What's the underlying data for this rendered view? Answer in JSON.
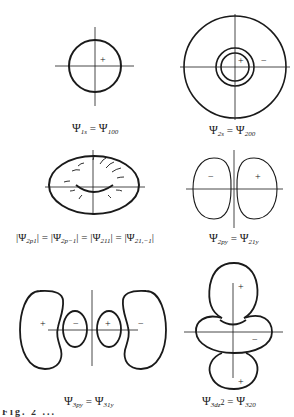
{
  "figure": {
    "panels": [
      {
        "id": "1s",
        "caption_lhs": "Ψ",
        "lhs_sub": "1s",
        "eq": " = ",
        "caption_rhs": "Ψ",
        "rhs_sub": "100",
        "signs": [
          "+"
        ]
      },
      {
        "id": "2s",
        "caption_lhs": "Ψ",
        "lhs_sub": "2s",
        "eq": " = ",
        "caption_rhs": "Ψ",
        "rhs_sub": "200",
        "signs": [
          "+",
          "−"
        ]
      },
      {
        "id": "2p1",
        "caption_text": "|Ψ",
        "sub1": "2p1",
        "t2": "| = |Ψ",
        "sub2": "2p−1",
        "t3": "| = |Ψ",
        "sub3": "211",
        "t4": "| = |Ψ",
        "sub4": "21,−1",
        "t5": "|"
      },
      {
        "id": "2py",
        "caption_lhs": "Ψ",
        "lhs_sub": "2py",
        "eq": " = ",
        "caption_rhs": "Ψ",
        "rhs_sub": "21y",
        "signs": [
          "−",
          "+"
        ]
      },
      {
        "id": "3py",
        "caption_lhs": "Ψ",
        "lhs_sub": "3py",
        "eq": " = ",
        "caption_rhs": "Ψ",
        "rhs_sub": "31y",
        "signs": [
          "+",
          "−",
          "+",
          "−"
        ]
      },
      {
        "id": "3dz2",
        "caption_lhs": "Ψ",
        "lhs_sub": "3dz",
        "lhs_sup": "2",
        "eq": " = ",
        "caption_rhs": "Ψ",
        "rhs_sub": "320",
        "signs": [
          "+",
          "−",
          "+"
        ]
      }
    ],
    "clipped_caption": "Fig. 2 ..."
  }
}
